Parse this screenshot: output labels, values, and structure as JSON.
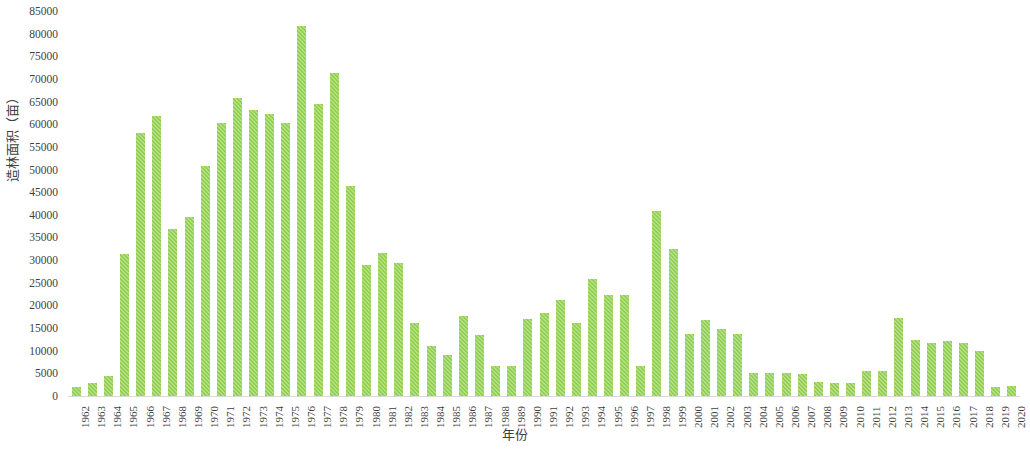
{
  "chart_data": {
    "type": "bar",
    "title": "",
    "xlabel": "年份",
    "ylabel": "造林面积（亩）",
    "ylim": [
      0,
      85000
    ],
    "ytick_step": 5000,
    "grid": false,
    "legend": null,
    "bar_color": "#92D050",
    "axis_color": "#D9D9D9",
    "text_color": "#3F3F3F",
    "yticks": [
      "0",
      "5000",
      "10000",
      "15000",
      "20000",
      "25000",
      "30000",
      "35000",
      "40000",
      "45000",
      "50000",
      "55000",
      "60000",
      "65000",
      "70000",
      "75000",
      "80000",
      "85000"
    ],
    "categories": [
      "1962",
      "1963",
      "1964",
      "1965",
      "1966",
      "1967",
      "1968",
      "1969",
      "1970",
      "1971",
      "1972",
      "1973",
      "1974",
      "1975",
      "1976",
      "1977",
      "1978",
      "1979",
      "1980",
      "1981",
      "1982",
      "1983",
      "1984",
      "1985",
      "1986",
      "1987",
      "1988",
      "1989",
      "1990",
      "1991",
      "1992",
      "1993",
      "1994",
      "1995",
      "1996",
      "1997",
      "1998",
      "1999",
      "2000",
      "2001",
      "2002",
      "2003",
      "2004",
      "2005",
      "2006",
      "2007",
      "2008",
      "2009",
      "2010",
      "2011",
      "2012",
      "2013",
      "2014",
      "2015",
      "2016",
      "2017",
      "2018",
      "2019",
      "2020"
    ],
    "values": [
      2200,
      3000,
      4700,
      31500,
      58300,
      62000,
      37000,
      39700,
      51000,
      60500,
      66000,
      63300,
      62500,
      60500,
      82000,
      64700,
      71500,
      46500,
      29200,
      31700,
      29500,
      16300,
      11200,
      9200,
      17900,
      13600,
      6800,
      6900,
      17300,
      18500,
      21500,
      16300,
      26000,
      22600,
      22500,
      6800,
      41000,
      32700,
      14000,
      17100,
      15000,
      14000,
      5200,
      5200,
      5200,
      5100,
      3400,
      3200,
      3200,
      5700,
      5700,
      17500,
      12500,
      12000,
      12300,
      12000,
      10200,
      2300,
      2400
    ]
  }
}
